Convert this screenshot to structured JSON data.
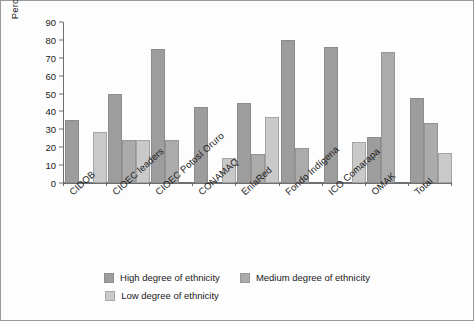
{
  "chart_data": {
    "type": "bar",
    "title": "",
    "xlabel": "",
    "ylabel": "Percentage",
    "ylim": [
      0,
      90
    ],
    "ytick_step": 10,
    "yticks": [
      90,
      80,
      70,
      60,
      50,
      40,
      30,
      20,
      10,
      0
    ],
    "grid": false,
    "legend_position": "bottom",
    "categories": [
      "CIDOB",
      "CIOEC leaders",
      "CIOEC Potosí Oruro",
      "CONAMAQ",
      "EnlaRed",
      "Fondo Indígena",
      "ICO Comarapa",
      "OMAK",
      "Total"
    ],
    "series": [
      {
        "name": "High degree of ethnicity",
        "color": "#9d9d9d",
        "values": [
          35,
          49.5,
          75,
          42.5,
          45,
          80,
          76,
          25.5,
          47.5
        ]
      },
      {
        "name": "Medium degree of ethnicity",
        "color": "#ababab",
        "values": [
          null,
          24,
          24,
          null,
          16,
          19.5,
          null,
          73.5,
          33.5
        ]
      },
      {
        "name": "Low degree of ethnicity",
        "color": "#c9c9c9",
        "values": [
          28.5,
          24,
          null,
          14,
          37,
          null,
          23,
          null,
          17
        ]
      }
    ]
  },
  "legend": {
    "items": [
      {
        "label": "High degree of ethnicity",
        "color": "#9d9d9d"
      },
      {
        "label": "Medium degree of ethnicity",
        "color": "#ababab"
      },
      {
        "label": "Low degree of ethnicity",
        "color": "#c9c9c9"
      }
    ]
  }
}
